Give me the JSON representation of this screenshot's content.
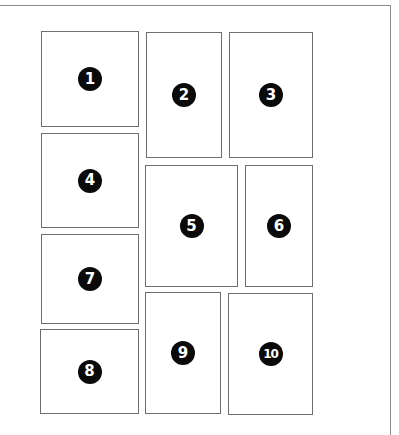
{
  "diagram": {
    "title": "",
    "panels": [
      {
        "label": "1",
        "x": 41,
        "y": 31,
        "w": 98,
        "h": 96
      },
      {
        "label": "2",
        "x": 146,
        "y": 32,
        "w": 76,
        "h": 126
      },
      {
        "label": "3",
        "x": 229,
        "y": 32,
        "w": 84,
        "h": 126
      },
      {
        "label": "4",
        "x": 41,
        "y": 133,
        "w": 98,
        "h": 95
      },
      {
        "label": "5",
        "x": 145,
        "y": 165,
        "w": 93,
        "h": 122
      },
      {
        "label": "6",
        "x": 245,
        "y": 165,
        "w": 68,
        "h": 122
      },
      {
        "label": "7",
        "x": 41,
        "y": 234,
        "w": 98,
        "h": 90
      },
      {
        "label": "8",
        "x": 40,
        "y": 329,
        "w": 99,
        "h": 85
      },
      {
        "label": "9",
        "x": 145,
        "y": 292,
        "w": 76,
        "h": 122
      },
      {
        "label": "10",
        "x": 228,
        "y": 293,
        "w": 85,
        "h": 122
      }
    ],
    "colors": {
      "badge_fill": "#0a0a0a",
      "badge_text": "#ffffff",
      "border": "#6e6e6e"
    }
  }
}
